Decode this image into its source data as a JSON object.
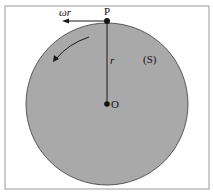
{
  "diagram": {
    "labels": {
      "velocity": "ωr",
      "point_p": "P",
      "radius": "r",
      "surface": "(S)",
      "center": "O"
    },
    "colors": {
      "disk_fill": "#a9a9a9",
      "stroke": "#1a1a1a",
      "frame": "#9a9a9a"
    }
  }
}
